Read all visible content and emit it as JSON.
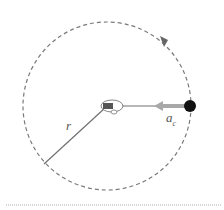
{
  "diagram": {
    "labels": {
      "radius": "r",
      "accel": "a",
      "accel_sub": "c"
    },
    "colors": {
      "circle": "#7a7a7a",
      "radius_line": "#707070",
      "accel_arrow": "#a8a8a8",
      "ball": "#111111",
      "divider": "#b0b0b0"
    }
  }
}
